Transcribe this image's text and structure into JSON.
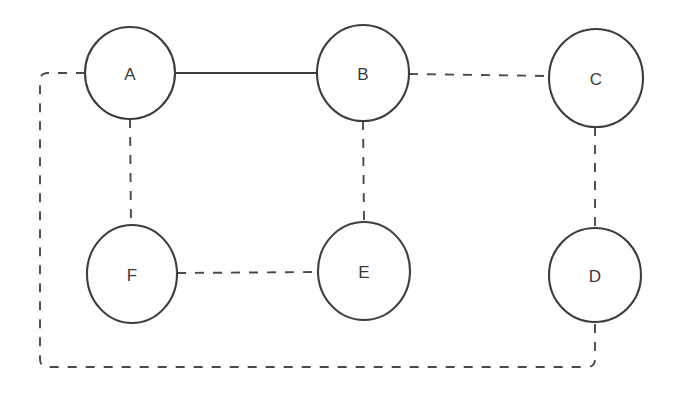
{
  "diagram": {
    "type": "graph",
    "title": "",
    "background_color": "#ffffff",
    "node_stroke_color": "#3d3d3d",
    "node_fill_color": "#ffffff",
    "label_color": "#3a3a3a",
    "edge_solid_color": "#3d3d3d",
    "edge_dashed_color": "#4a4a4a",
    "nodes": [
      {
        "id": "A",
        "label": "A",
        "cx": 130,
        "cy": 73,
        "rx": 45,
        "ry": 46
      },
      {
        "id": "B",
        "label": "B",
        "cx": 363,
        "cy": 73,
        "rx": 46,
        "ry": 48
      },
      {
        "id": "C",
        "label": "C",
        "cx": 596,
        "cy": 78,
        "rx": 47,
        "ry": 49
      },
      {
        "id": "D",
        "label": "D",
        "cx": 595,
        "cy": 275,
        "rx": 46,
        "ry": 47
      },
      {
        "id": "E",
        "label": "E",
        "cx": 364,
        "cy": 271,
        "rx": 46,
        "ry": 49
      },
      {
        "id": "F",
        "label": "F",
        "cx": 132,
        "cy": 274,
        "rx": 45,
        "ry": 49
      }
    ],
    "edges": [
      {
        "from": "A",
        "to": "B",
        "style": "solid"
      },
      {
        "from": "B",
        "to": "C",
        "style": "dashed"
      },
      {
        "from": "C",
        "to": "D",
        "style": "dashed"
      },
      {
        "from": "A",
        "to": "F",
        "style": "dashed"
      },
      {
        "from": "B",
        "to": "E",
        "style": "dashed"
      },
      {
        "from": "F",
        "to": "E",
        "style": "dashed"
      },
      {
        "from": "A",
        "to": "D",
        "style": "dashed",
        "routing": "wraparound-bottom-left"
      }
    ]
  }
}
